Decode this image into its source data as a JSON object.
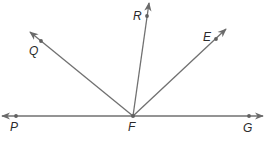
{
  "diagram": {
    "type": "geometry-rays",
    "stroke_color": "#707070",
    "point_color": "#606060",
    "label_color": "#2a2a2a",
    "vertex": {
      "label": "F",
      "x": 133,
      "y": 116,
      "label_x": 128,
      "label_y": 131
    },
    "line": {
      "name": "PG",
      "from": {
        "x": 2,
        "y": 116
      },
      "to": {
        "x": 263,
        "y": 116
      },
      "points": [
        {
          "label": "P",
          "x": 16,
          "y": 116,
          "label_x": 10,
          "label_y": 131
        },
        {
          "label": "G",
          "x": 249,
          "y": 116,
          "label_x": 243,
          "label_y": 132
        }
      ]
    },
    "rays": [
      {
        "name": "FQ",
        "end": {
          "x": 30,
          "y": 32
        },
        "point": {
          "label": "Q",
          "x": 41,
          "y": 41,
          "label_x": 29,
          "label_y": 55
        }
      },
      {
        "name": "FR",
        "end": {
          "x": 149,
          "y": 3
        },
        "point": {
          "label": "R",
          "x": 147,
          "y": 16,
          "label_x": 133,
          "label_y": 20
        }
      },
      {
        "name": "FE",
        "end": {
          "x": 226,
          "y": 29
        },
        "point": {
          "label": "E",
          "x": 216,
          "y": 39,
          "label_x": 203,
          "label_y": 41
        }
      }
    ]
  },
  "labels": {
    "P": "P",
    "F": "F",
    "G": "G",
    "Q": "Q",
    "R": "R",
    "E": "E"
  }
}
